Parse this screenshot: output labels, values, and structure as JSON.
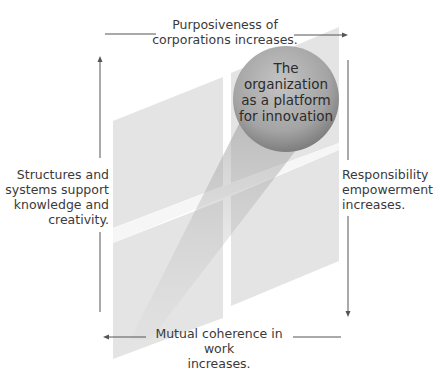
{
  "diagram": {
    "center_label": {
      "lines": [
        "The",
        "organization",
        "as a platform",
        "for innovation"
      ]
    },
    "top_label": {
      "lines": [
        "Purposiveness of",
        "corporations increases."
      ],
      "arrow_direction": "right"
    },
    "right_label": {
      "lines": [
        "Responsibility",
        "empowerment",
        "increases."
      ],
      "arrow_direction": "down"
    },
    "bottom_label": {
      "lines": [
        "Mutual coherence in work",
        "increases."
      ],
      "arrow_direction": "left"
    },
    "left_label": {
      "lines": [
        "Structures and",
        "systems support",
        "knowledge and",
        "creativity."
      ],
      "arrow_direction": "up"
    },
    "colors": {
      "panel": "#e3e3e3",
      "shadow": "#b5b5b5",
      "circle_light": "#b8b8b8",
      "circle_dark": "#7d7d7d",
      "line": "#555555",
      "text": "#3a3a3a"
    }
  }
}
